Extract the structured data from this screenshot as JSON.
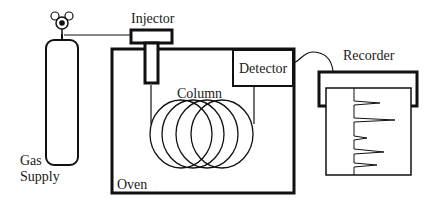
{
  "diagram": {
    "labels": {
      "gas_supply_line1": "Gas",
      "gas_supply_line2": "Supply",
      "injector": "Injector",
      "detector": "Detector",
      "column": "Column",
      "oven": "Oven",
      "recorder": "Recorder"
    },
    "components": [
      {
        "id": "gas-cylinder",
        "label": "Gas Supply"
      },
      {
        "id": "injector",
        "label": "Injector"
      },
      {
        "id": "oven",
        "label": "Oven"
      },
      {
        "id": "column",
        "label": "Column",
        "coils": 4
      },
      {
        "id": "detector",
        "label": "Detector"
      },
      {
        "id": "recorder",
        "label": "Recorder",
        "peaks": 5
      }
    ],
    "connections": [
      {
        "from": "gas-cylinder",
        "to": "injector"
      },
      {
        "from": "injector",
        "to": "column"
      },
      {
        "from": "column",
        "to": "detector"
      },
      {
        "from": "detector",
        "to": "recorder"
      }
    ],
    "colors": {
      "stroke": "#111111",
      "background": "#ffffff"
    }
  }
}
